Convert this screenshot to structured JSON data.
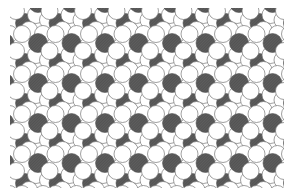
{
  "figure": {
    "colors": {
      "dark_sphere": "#5a5a5a",
      "white_sphere": "#ffffff",
      "outline": "#6e6e6e",
      "background": "#ffffff"
    },
    "lattice": {
      "origin_x": 38,
      "origin_y": 43,
      "period_x": 33.5,
      "period_y": 40,
      "columns": 8,
      "rows": 4
    }
  }
}
